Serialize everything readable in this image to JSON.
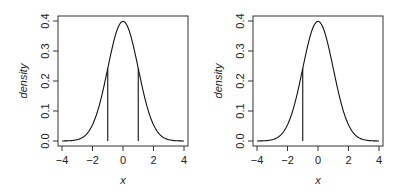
{
  "chart_data": [
    {
      "type": "line",
      "title": "",
      "xlabel": "x",
      "ylabel": "density",
      "xlim": [
        -4,
        4
      ],
      "ylim": [
        0,
        0.4
      ],
      "xticks": [
        "-4",
        "-2",
        "0",
        "2",
        "4"
      ],
      "yticks": [
        "0.0",
        "0.1",
        "0.2",
        "0.3",
        "0.4"
      ],
      "grid": false,
      "legend": null,
      "series": [
        {
          "name": "standard normal density",
          "function": "dnorm(x)",
          "x_range": [
            -4,
            4
          ]
        }
      ],
      "vertical_lines": [
        {
          "x": -1,
          "y_top": 0.242
        },
        {
          "x": 1,
          "y_top": 0.242
        }
      ]
    },
    {
      "type": "line",
      "title": "",
      "xlabel": "x",
      "ylabel": "density",
      "xlim": [
        -4,
        4
      ],
      "ylim": [
        0,
        0.4
      ],
      "xticks": [
        "-4",
        "-2",
        "0",
        "2",
        "4"
      ],
      "yticks": [
        "0.0",
        "0.1",
        "0.2",
        "0.3",
        "0.4"
      ],
      "grid": false,
      "legend": null,
      "series": [
        {
          "name": "standard normal density",
          "function": "dnorm(x)",
          "x_range": [
            -4,
            4
          ]
        }
      ],
      "vertical_lines": [
        {
          "x": -1,
          "y_top": 0.242
        }
      ]
    }
  ],
  "panels": [
    {
      "xlabel": "x",
      "ylabel": "density",
      "xticks": [
        "-4",
        "-2",
        "0",
        "2",
        "4"
      ],
      "yticks": [
        "0.0",
        "0.1",
        "0.2",
        "0.3",
        "0.4"
      ]
    },
    {
      "xlabel": "x",
      "ylabel": "density",
      "xticks": [
        "-4",
        "-2",
        "0",
        "2",
        "4"
      ],
      "yticks": [
        "0.0",
        "0.1",
        "0.2",
        "0.3",
        "0.4"
      ]
    }
  ]
}
